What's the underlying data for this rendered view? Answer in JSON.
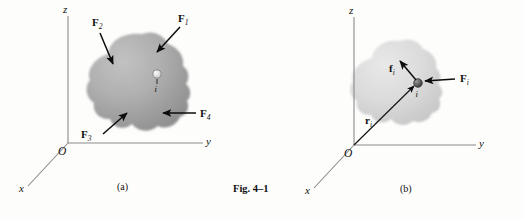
{
  "figure": {
    "name": "Fig. 4–1",
    "panels": [
      {
        "id": "a",
        "caption": "(a)",
        "axes": {
          "x": "x",
          "y": "y",
          "z": "z",
          "origin": "O"
        },
        "particle_label": "i",
        "forces": [
          {
            "name": "F",
            "sub": "1",
            "label": "F₁",
            "position": "top-right",
            "direction": "down-left"
          },
          {
            "name": "F",
            "sub": "2",
            "label": "F₂",
            "position": "top-left",
            "direction": "down-right"
          },
          {
            "name": "F",
            "sub": "3",
            "label": "F₃",
            "position": "bottom-left",
            "direction": "up-right"
          },
          {
            "name": "F",
            "sub": "4",
            "label": "F₄",
            "position": "right",
            "direction": "left"
          }
        ]
      },
      {
        "id": "b",
        "caption": "(b)",
        "axes": {
          "x": "x",
          "y": "y",
          "z": "z",
          "origin": "O"
        },
        "particle_label": "i",
        "vectors": [
          {
            "name": "F",
            "sub": "i",
            "label": "Fᵢ",
            "kind": "external-force",
            "direction": "left"
          },
          {
            "name": "f",
            "sub": "i",
            "label": "fᵢ",
            "kind": "internal-force",
            "direction": "up-left"
          },
          {
            "name": "r",
            "sub": "i",
            "label": "rᵢ",
            "kind": "position-vector",
            "direction": "up-right-from-origin"
          }
        ]
      }
    ]
  },
  "colors": {
    "background": "#fdfdfc",
    "axis": "#8a8a8a",
    "vector": "#0c0c0c",
    "text": "#111111",
    "blob_a_light": "#b9b9b9",
    "blob_a_dark": "#9a9a9a",
    "blob_b_light": "#e2e2e2",
    "blob_b_dark": "#cfcfcf"
  }
}
